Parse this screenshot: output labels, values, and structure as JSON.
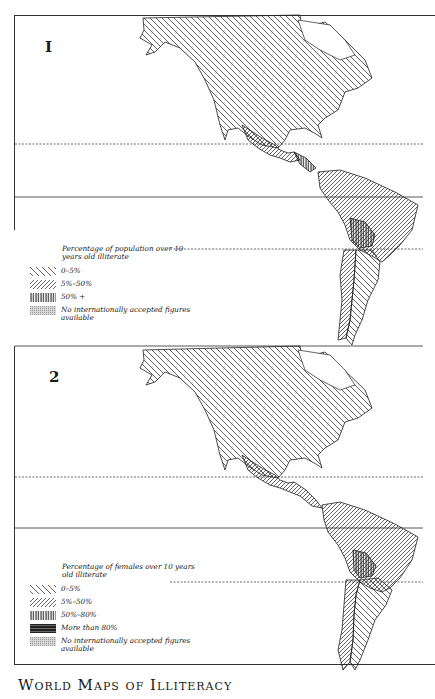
{
  "page": {
    "caption": "World Maps of Illiteracy"
  },
  "maps": [
    {
      "number": "I",
      "region": "Americas",
      "legend": {
        "title": "Percentage of population over 10 years old illiterate",
        "items": [
          {
            "pattern": "hatch-thin-backslash",
            "label": "0–5%"
          },
          {
            "pattern": "hatch-dense-slash",
            "label": "5%–50%"
          },
          {
            "pattern": "vertical-lines",
            "label": "50% +"
          },
          {
            "pattern": "stipple",
            "label": "No internationally accepted figures available"
          }
        ]
      }
    },
    {
      "number": "2",
      "region": "Americas",
      "legend": {
        "title": "Percentage of females over 10 years old illiterate",
        "items": [
          {
            "pattern": "hatch-thin-backslash",
            "label": "0–5%"
          },
          {
            "pattern": "hatch-dense-slash",
            "label": "5%–50%"
          },
          {
            "pattern": "vertical-lines",
            "label": "50%–80%"
          },
          {
            "pattern": "grid-dark",
            "label": "More than 80%"
          },
          {
            "pattern": "stipple",
            "label": "No internationally accepted figures available"
          }
        ]
      }
    }
  ]
}
